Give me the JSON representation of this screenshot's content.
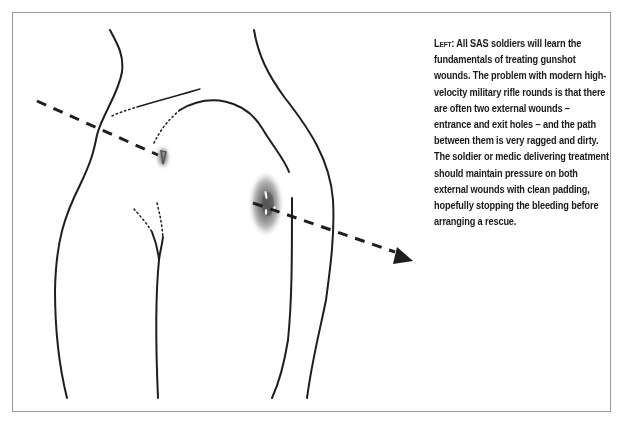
{
  "figure": {
    "caption": {
      "lead": "Left:",
      "text": " All SAS soldiers will learn the fundamentals of treating gunshot wounds. The problem with modern high-velocity military rifle rounds is that there are often two external wounds – entrance and exit holes – and the path between them is very ragged and dirty. The soldier or medic delivering treatment should maintain pressure on both external wounds with clean padding, hopefully stopping the bleeding before arranging a rescue."
    },
    "illustration": {
      "subject": "human thigh/hip outline with bullet trajectory",
      "elements": [
        "body-outline",
        "bullet-path-dashed-arrow",
        "entry-wound",
        "exit-wound"
      ]
    },
    "colors": {
      "line": "#1e1e1e",
      "frame": "#9a9a9a",
      "wound_outer": "#b8b8b8",
      "wound_inner": "#6e6e6e"
    }
  }
}
